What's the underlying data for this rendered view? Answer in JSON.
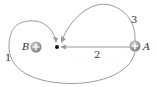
{
  "diagram": {
    "type": "physics-electric-field-paths",
    "charges": [
      {
        "name": "B",
        "sign": "+",
        "x": 36,
        "y": 47
      },
      {
        "name": "A",
        "sign": "+",
        "x": 135,
        "y": 46
      }
    ],
    "point": {
      "x": 57,
      "y": 47
    },
    "paths": [
      {
        "label": "1",
        "description": "large loop around B from A to point"
      },
      {
        "label": "2",
        "description": "straight line from A to point"
      },
      {
        "label": "3",
        "description": "loop above from A to point"
      }
    ],
    "colors": {
      "path": "#9a9a9a",
      "charge_fill": "#8a8a8a",
      "text": "#333333",
      "point": "#111111"
    }
  },
  "labels": {
    "charge_b": "B",
    "charge_a": "A",
    "path_1": "1",
    "path_2": "2",
    "path_3": "3"
  }
}
